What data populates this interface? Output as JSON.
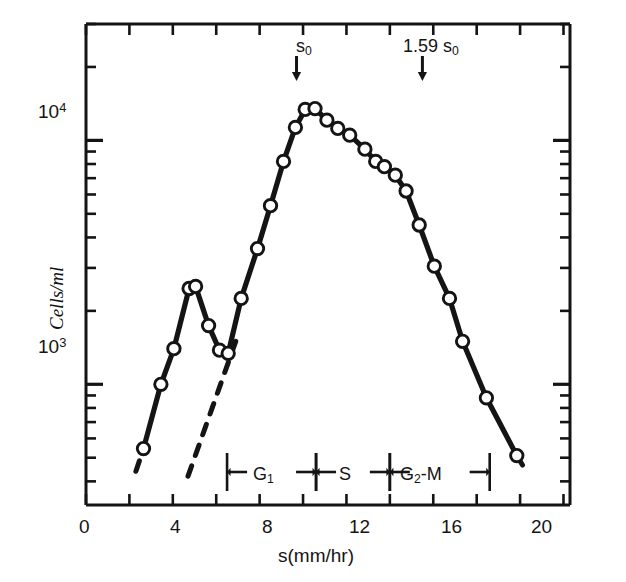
{
  "figure": {
    "title": "",
    "background": "#ffffff",
    "ink_color": "#141414"
  },
  "axes": {
    "y": {
      "label": "Cells/ml",
      "scale": "log",
      "major_ticks": [
        {
          "value": 1000,
          "mantissa": "10",
          "exponent": "3"
        },
        {
          "value": 10000,
          "mantissa": "10",
          "exponent": "4"
        }
      ],
      "range": [
        320,
        30000
      ]
    },
    "x": {
      "label": "s(mm/hr)",
      "scale": "linear",
      "tick_labels": [
        "0",
        "4",
        "8",
        "12",
        "16",
        "20"
      ],
      "tick_values": [
        0,
        4,
        8,
        12,
        16,
        20
      ],
      "minor_tick_values": [
        2,
        6,
        10,
        14,
        18,
        22
      ],
      "range": [
        0,
        22.3
      ]
    }
  },
  "annotations": [
    {
      "name": "s0-marker",
      "text": "s",
      "sub": "0",
      "x": 9.7,
      "arrow": "down"
    },
    {
      "name": "1.59-s0-marker",
      "text": "1.59 s",
      "sub": "0",
      "x": 15.5,
      "arrow": "down"
    }
  ],
  "phase_brackets": [
    {
      "name": "G1",
      "label_main": "G",
      "label_sub": "1",
      "x_start": 6.5,
      "x_end": 10.6
    },
    {
      "name": "S",
      "label_main": "S",
      "label_sub": "",
      "x_start": 10.6,
      "x_end": 14.0
    },
    {
      "name": "G2M",
      "label_main": "G",
      "label_sub": "2",
      "label_tail": "-M",
      "x_start": 14.0,
      "x_end": 18.6
    }
  ],
  "chart_data": {
    "type": "scatter",
    "title": "",
    "xlabel": "s(mm/hr)",
    "ylabel": "Cells/ml",
    "xscale": "linear",
    "yscale": "log",
    "xlim": [
      0,
      22.3
    ],
    "ylim": [
      320,
      30000
    ],
    "grid": false,
    "legend": null,
    "marker": "open-circle",
    "series": [
      {
        "name": "cell-distribution",
        "line_style": "solid",
        "x": [
          2.65,
          3.45,
          4.05,
          4.75,
          5.05,
          5.65,
          6.15,
          6.55,
          7.15,
          7.9,
          8.5,
          9.1,
          9.65,
          10.1,
          10.55,
          11.1,
          11.6,
          12.15,
          12.85,
          13.35,
          13.75,
          14.25,
          14.75,
          15.35,
          16.05,
          16.75,
          17.35,
          18.45,
          19.85
        ],
        "y": [
          545,
          1000,
          1400,
          2470,
          2520,
          1740,
          1380,
          1340,
          2250,
          3600,
          5400,
          8200,
          11300,
          13400,
          13500,
          12100,
          11200,
          10500,
          9200,
          8200,
          7800,
          7200,
          6200,
          4500,
          3050,
          2250,
          1500,
          880,
          510
        ]
      },
      {
        "name": "deconvolution-guide",
        "line_style": "dashed",
        "x": [
          4.7,
          6.9
        ],
        "y": [
          420,
          1500
        ]
      },
      {
        "name": "left-tail-dashed",
        "line_style": "dashed",
        "x": [
          2.3,
          2.65
        ],
        "y": [
          440,
          545
        ]
      },
      {
        "name": "right-tail-dashed",
        "line_style": "dashed",
        "x": [
          19.85,
          20.35
        ],
        "y": [
          510,
          430
        ]
      }
    ]
  },
  "caption": {
    "text": ""
  }
}
